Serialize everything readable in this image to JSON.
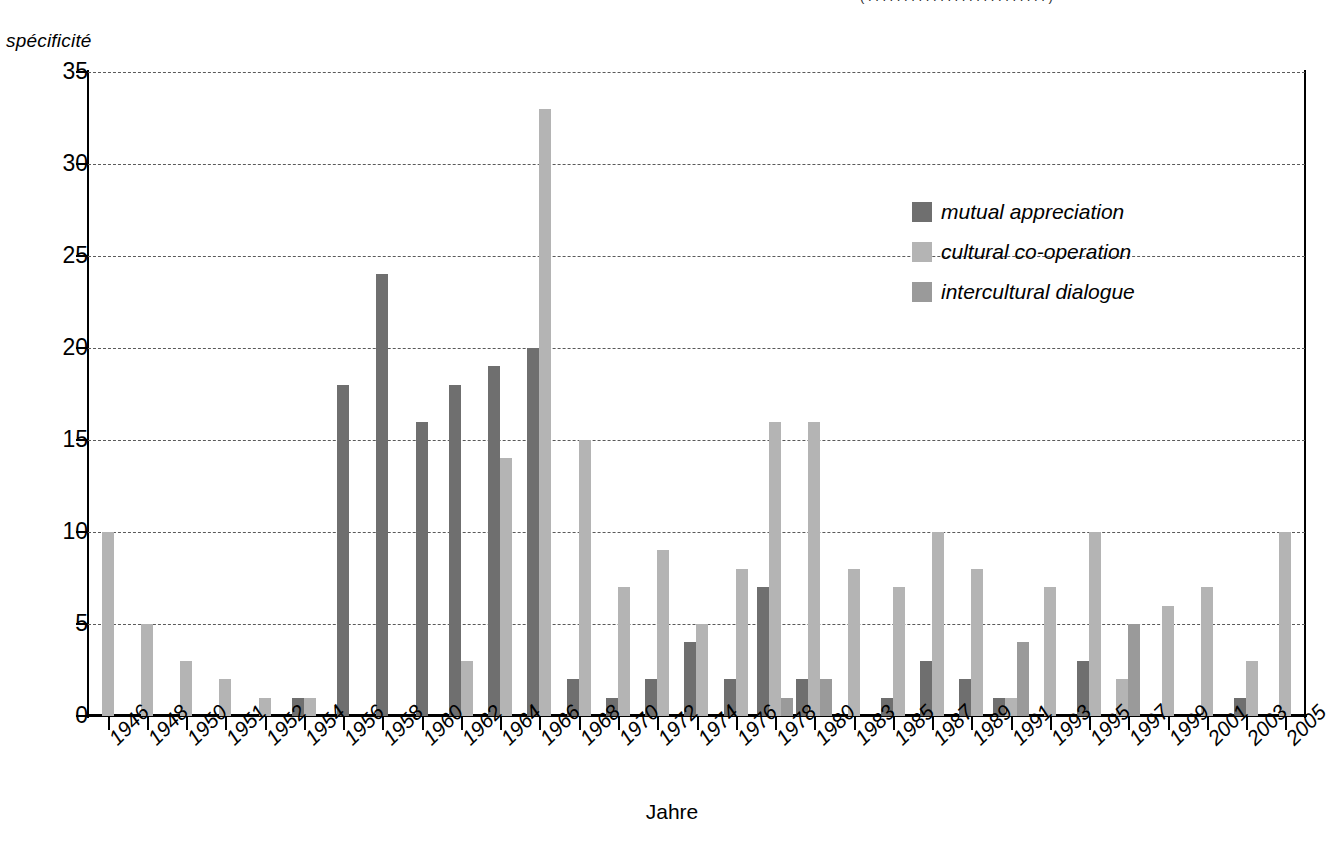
{
  "ylabel_caption": "spécificité",
  "top_partial_text": "( . . . . . . . . . . . . . . . . . . . . . . . . . )",
  "legend": {
    "items": [
      {
        "label": "mutual appreciation",
        "color": "#6f6f6f"
      },
      {
        "label": "cultural co-operation",
        "color": "#b4b4b4"
      },
      {
        "label": "intercultural dialogue",
        "color": "#9a9a9a"
      }
    ]
  },
  "chart_data": {
    "type": "bar",
    "title": "",
    "xlabel": "Jahre",
    "ylabel": "spécificité",
    "ylim": [
      0,
      35
    ],
    "yticks": [
      0,
      5,
      10,
      15,
      20,
      25,
      30,
      35
    ],
    "grid": true,
    "legend_position": "upper-right-inside",
    "categories": [
      "1946",
      "1948",
      "1950",
      "1951",
      "1952",
      "1954",
      "1956",
      "1958",
      "1960",
      "1962",
      "1964",
      "1966",
      "1968",
      "1970",
      "1972",
      "1974",
      "1976",
      "1978",
      "1980",
      "1983",
      "1985",
      "1987",
      "1989",
      "1991",
      "1993",
      "1995",
      "1997",
      "1999",
      "2001",
      "2003",
      "2005"
    ],
    "series": [
      {
        "name": "mutual appreciation",
        "color": "#6f6f6f",
        "values": [
          0,
          0,
          0,
          0,
          0,
          1,
          18,
          24,
          16,
          18,
          19,
          20,
          2,
          1,
          2,
          4,
          2,
          7,
          2,
          0,
          1,
          3,
          2,
          1,
          0,
          3,
          0,
          0,
          0,
          1,
          0
        ]
      },
      {
        "name": "cultural co-operation",
        "color": "#b4b4b4",
        "values": [
          10,
          5,
          3,
          2,
          1,
          1,
          0,
          0,
          0,
          3,
          14,
          33,
          15,
          7,
          9,
          5,
          8,
          16,
          16,
          8,
          7,
          10,
          8,
          1,
          7,
          10,
          2,
          6,
          7,
          3,
          10
        ]
      },
      {
        "name": "intercultural dialogue",
        "color": "#9a9a9a",
        "values": [
          0,
          0,
          0,
          0,
          0,
          0,
          0,
          0,
          0,
          0,
          0,
          0,
          0,
          0,
          0,
          0,
          0,
          1,
          2,
          0,
          0,
          0,
          0,
          4,
          0,
          0,
          5,
          0,
          0,
          0,
          0
        ]
      }
    ]
  }
}
